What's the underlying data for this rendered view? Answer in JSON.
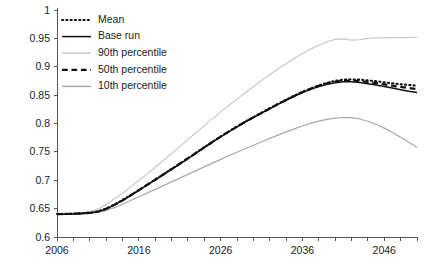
{
  "chart_data": {
    "type": "line",
    "title": "",
    "xlabel": "",
    "ylabel": "",
    "xlim": [
      2006,
      2050
    ],
    "ylim": [
      0.6,
      1.0
    ],
    "grid": false,
    "legend_position": "top-left",
    "x_ticks": [
      2006,
      2016,
      2026,
      2036,
      2046
    ],
    "x_tick_labels": [
      "2006",
      "2016",
      "2026",
      "2036",
      "2046"
    ],
    "x_minor_tick_step": 2,
    "y_ticks": [
      0.6,
      0.65,
      0.7,
      0.75,
      0.8,
      0.85,
      0.9,
      0.95,
      1
    ],
    "y_tick_labels": [
      "0.6",
      "0.65",
      "0.7",
      "0.75",
      "0.8",
      "0.85",
      "0.9",
      "0.95",
      "1"
    ],
    "x": [
      2006,
      2007,
      2008,
      2009,
      2010,
      2011,
      2012,
      2013,
      2014,
      2015,
      2016,
      2017,
      2018,
      2019,
      2020,
      2021,
      2022,
      2023,
      2024,
      2025,
      2026,
      2027,
      2028,
      2029,
      2030,
      2031,
      2032,
      2033,
      2034,
      2035,
      2036,
      2037,
      2038,
      2039,
      2040,
      2041,
      2042,
      2043,
      2044,
      2045,
      2046,
      2047,
      2048,
      2049,
      2050
    ],
    "series": [
      {
        "name": "Mean",
        "style": "dotted",
        "color": "#111111",
        "width": 2.1,
        "values": [
          0.6405,
          0.6408,
          0.6412,
          0.6418,
          0.6428,
          0.6452,
          0.65,
          0.657,
          0.665,
          0.6738,
          0.6828,
          0.692,
          0.7012,
          0.7105,
          0.7198,
          0.7292,
          0.7388,
          0.7485,
          0.7582,
          0.7678,
          0.7772,
          0.7862,
          0.7948,
          0.8032,
          0.8112,
          0.819,
          0.8268,
          0.8345,
          0.842,
          0.8492,
          0.8558,
          0.8618,
          0.8672,
          0.8718,
          0.8752,
          0.8772,
          0.8778,
          0.8772,
          0.876,
          0.8744,
          0.8726,
          0.8708,
          0.8692,
          0.8678,
          0.8668
        ]
      },
      {
        "name": "Base run",
        "style": "solid",
        "color": "#111111",
        "width": 1.5,
        "values": [
          0.64,
          0.6402,
          0.6406,
          0.6412,
          0.6422,
          0.6445,
          0.6492,
          0.6562,
          0.6642,
          0.673,
          0.682,
          0.6912,
          0.7004,
          0.7098,
          0.7192,
          0.7286,
          0.7382,
          0.7478,
          0.7575,
          0.767,
          0.7764,
          0.7854,
          0.794,
          0.8024,
          0.8104,
          0.8182,
          0.826,
          0.8336,
          0.841,
          0.848,
          0.8544,
          0.8602,
          0.8652,
          0.8692,
          0.872,
          0.8734,
          0.8734,
          0.8722,
          0.8702,
          0.8678,
          0.8652,
          0.8624,
          0.8596,
          0.857,
          0.8548
        ]
      },
      {
        "name": "90th percentile",
        "style": "solid",
        "color": "#c9c9c9",
        "width": 1.2,
        "values": [
          0.641,
          0.6414,
          0.642,
          0.643,
          0.645,
          0.6495,
          0.657,
          0.6668,
          0.6772,
          0.6882,
          0.6995,
          0.711,
          0.7228,
          0.7348,
          0.747,
          0.7592,
          0.7716,
          0.784,
          0.7962,
          0.8082,
          0.82,
          0.8316,
          0.843,
          0.8542,
          0.8652,
          0.8758,
          0.8862,
          0.8962,
          0.9058,
          0.9148,
          0.9232,
          0.931,
          0.938,
          0.944,
          0.9482,
          0.9492,
          0.947,
          0.9478,
          0.95,
          0.9508,
          0.951,
          0.9512,
          0.9514,
          0.9516,
          0.9518
        ]
      },
      {
        "name": "50th percentile",
        "style": "dashed",
        "color": "#111111",
        "width": 2.2,
        "values": [
          0.6402,
          0.6405,
          0.6409,
          0.6415,
          0.6425,
          0.6449,
          0.6496,
          0.6566,
          0.6646,
          0.6734,
          0.6824,
          0.6916,
          0.7008,
          0.7102,
          0.7196,
          0.729,
          0.7386,
          0.7482,
          0.7579,
          0.7674,
          0.7768,
          0.7858,
          0.7944,
          0.8028,
          0.8108,
          0.8186,
          0.8264,
          0.834,
          0.8415,
          0.8486,
          0.8551,
          0.861,
          0.8662,
          0.8705,
          0.8736,
          0.8753,
          0.8756,
          0.8747,
          0.8731,
          0.8711,
          0.8689,
          0.8666,
          0.8644,
          0.8624,
          0.8608
        ]
      },
      {
        "name": "10th percentile",
        "style": "solid",
        "color": "#a8a8a8",
        "width": 1.2,
        "values": [
          0.6398,
          0.6399,
          0.6402,
          0.6406,
          0.6414,
          0.6432,
          0.6466,
          0.6518,
          0.6578,
          0.6642,
          0.6708,
          0.6774,
          0.684,
          0.6906,
          0.6972,
          0.7038,
          0.7104,
          0.717,
          0.7236,
          0.7302,
          0.7368,
          0.7432,
          0.7494,
          0.7556,
          0.7618,
          0.7678,
          0.7738,
          0.7796,
          0.7852,
          0.7906,
          0.7956,
          0.8002,
          0.8042,
          0.8074,
          0.8096,
          0.8106,
          0.8102,
          0.808,
          0.804,
          0.7986,
          0.7918,
          0.784,
          0.7756,
          0.7668,
          0.7576
        ]
      }
    ],
    "legend_entries": [
      {
        "label": "Mean",
        "style": "dotted",
        "color": "#111111"
      },
      {
        "label": "Base run",
        "style": "solid",
        "color": "#111111"
      },
      {
        "label": "90th percentile",
        "style": "solid",
        "color": "#c9c9c9"
      },
      {
        "label": "50th percentile",
        "style": "dashed",
        "color": "#111111"
      },
      {
        "label": "10th percentile",
        "style": "solid",
        "color": "#a8a8a8"
      }
    ]
  }
}
